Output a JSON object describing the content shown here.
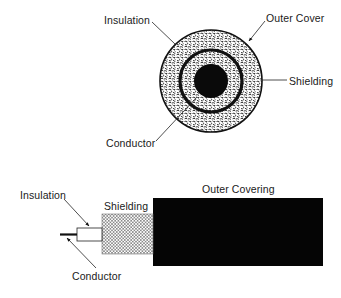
{
  "cross_section": {
    "title": "Coaxial cable cross-section",
    "labels": {
      "insulation": "Insulation",
      "outer_cover": "Outer Cover",
      "shielding": "Shielding",
      "conductor": "Conductor"
    },
    "geometry": {
      "center": [
        211,
        81
      ],
      "outer_radius": 51,
      "shield_radius": 32,
      "conductor_radius": 17
    }
  },
  "side_view": {
    "title": "Coaxial cable side view",
    "labels": {
      "insulation": "Insulation",
      "shielding": "Shielding",
      "outer_covering": "Outer Covering",
      "conductor": "Conductor"
    }
  },
  "colors": {
    "ink": "#111111",
    "paper": "#ffffff"
  }
}
